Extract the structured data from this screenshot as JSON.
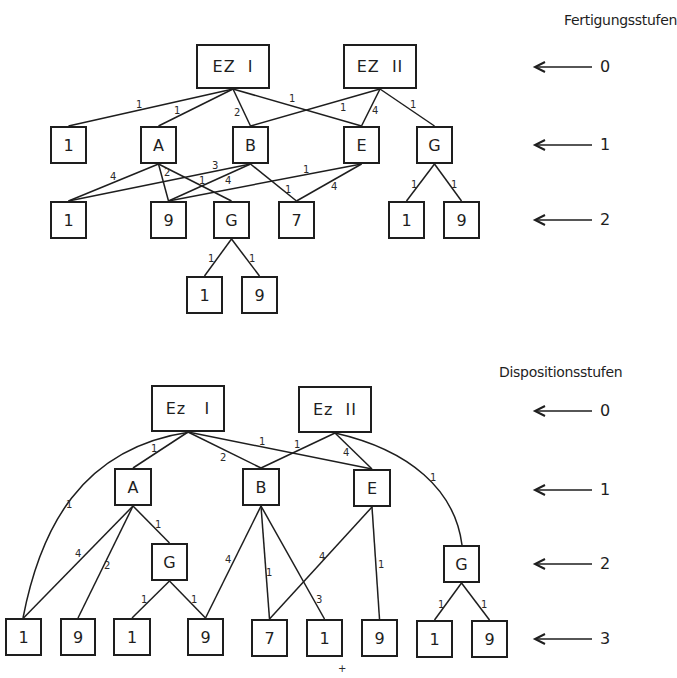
{
  "diagrams": [
    {
      "id": "fertigung",
      "title": "Fertigungsstufen",
      "title_pos": [
        564,
        12
      ],
      "levels": [
        {
          "label": "0",
          "y": 67
        },
        {
          "label": "1",
          "y": 145
        },
        {
          "label": "2",
          "y": 220
        }
      ],
      "nodes": [
        {
          "id": "t_ez1",
          "label": "EZ  I",
          "x": 196,
          "y": 44,
          "w": 74,
          "h": 45,
          "root": true
        },
        {
          "id": "t_ez2",
          "label": "EZ  II",
          "x": 343,
          "y": 44,
          "w": 74,
          "h": 45,
          "root": true
        },
        {
          "id": "t_l1_1",
          "label": "1",
          "x": 50,
          "y": 126,
          "w": 37,
          "h": 38
        },
        {
          "id": "t_l1_A",
          "label": "A",
          "x": 140,
          "y": 126,
          "w": 37,
          "h": 38
        },
        {
          "id": "t_l1_B",
          "label": "B",
          "x": 232,
          "y": 126,
          "w": 37,
          "h": 38
        },
        {
          "id": "t_l1_E",
          "label": "E",
          "x": 343,
          "y": 126,
          "w": 37,
          "h": 38
        },
        {
          "id": "t_l1_G",
          "label": "G",
          "x": 416,
          "y": 126,
          "w": 37,
          "h": 38
        },
        {
          "id": "t_l2_1",
          "label": "1",
          "x": 50,
          "y": 201,
          "w": 37,
          "h": 38
        },
        {
          "id": "t_l2_9",
          "label": "9",
          "x": 150,
          "y": 201,
          "w": 37,
          "h": 38
        },
        {
          "id": "t_l2_G",
          "label": "G",
          "x": 213,
          "y": 201,
          "w": 37,
          "h": 38
        },
        {
          "id": "t_l2_7",
          "label": "7",
          "x": 278,
          "y": 201,
          "w": 37,
          "h": 38
        },
        {
          "id": "t_l2_1b",
          "label": "1",
          "x": 388,
          "y": 201,
          "w": 37,
          "h": 38
        },
        {
          "id": "t_l2_9b",
          "label": "9",
          "x": 443,
          "y": 201,
          "w": 37,
          "h": 38
        },
        {
          "id": "t_l3_1",
          "label": "1",
          "x": 186,
          "y": 276,
          "w": 37,
          "h": 38
        },
        {
          "id": "t_l3_9",
          "label": "9",
          "x": 241,
          "y": 276,
          "w": 37,
          "h": 38
        }
      ],
      "edges": [
        {
          "from": "t_ez1",
          "to": "t_l1_1",
          "qty": "1",
          "lx": 136,
          "ly": 100
        },
        {
          "from": "t_ez1",
          "to": "t_l1_A",
          "qty": "1",
          "lx": 174,
          "ly": 106
        },
        {
          "from": "t_ez1",
          "to": "t_l1_B",
          "qty": "2",
          "lx": 234,
          "ly": 108
        },
        {
          "from": "t_ez1",
          "to": "t_l1_E",
          "qty": "1",
          "lx": 289,
          "ly": 94
        },
        {
          "from": "t_ez2",
          "to": "t_l1_B",
          "qty": "1",
          "lx": 340,
          "ly": 103
        },
        {
          "from": "t_ez2",
          "to": "t_l1_E",
          "qty": "4",
          "lx": 372,
          "ly": 106
        },
        {
          "from": "t_ez2",
          "to": "t_l1_G",
          "qty": "1",
          "lx": 410,
          "ly": 100
        },
        {
          "from": "t_l1_A",
          "to": "t_l2_1",
          "qty": "4",
          "lx": 110,
          "ly": 172
        },
        {
          "from": "t_l1_A",
          "to": "t_l2_9",
          "qty": "2",
          "lx": 164,
          "ly": 168
        },
        {
          "from": "t_l1_A",
          "to": "t_l2_G",
          "qty": "1",
          "lx": 199,
          "ly": 176
        },
        {
          "from": "t_l1_B",
          "to": "t_l2_1",
          "qty": "3",
          "lx": 212,
          "ly": 161
        },
        {
          "from": "t_l1_B",
          "to": "t_l2_9",
          "qty": "4",
          "lx": 225,
          "ly": 176
        },
        {
          "from": "t_l1_B",
          "to": "t_l2_7",
          "qty": "1",
          "lx": 285,
          "ly": 185
        },
        {
          "from": "t_l1_E",
          "to": "t_l2_9",
          "qty": "1",
          "lx": 303,
          "ly": 165
        },
        {
          "from": "t_l1_E",
          "to": "t_l2_7",
          "qty": "4",
          "lx": 331,
          "ly": 182
        },
        {
          "from": "t_l1_G",
          "to": "t_l2_1b",
          "qty": "1",
          "lx": 411,
          "ly": 180
        },
        {
          "from": "t_l1_G",
          "to": "t_l2_9b",
          "qty": "1",
          "lx": 451,
          "ly": 180
        },
        {
          "from": "t_l2_G",
          "to": "t_l3_1",
          "qty": "1",
          "lx": 208,
          "ly": 254
        },
        {
          "from": "t_l2_G",
          "to": "t_l3_9",
          "qty": "1",
          "lx": 249,
          "ly": 254
        }
      ]
    },
    {
      "id": "disposition",
      "title": "Dispositionsstufen",
      "title_pos": [
        499,
        364
      ],
      "levels": [
        {
          "label": "0",
          "y": 411
        },
        {
          "label": "1",
          "y": 490
        },
        {
          "label": "2",
          "y": 564
        },
        {
          "label": "3",
          "y": 639
        }
      ],
      "nodes": [
        {
          "id": "b_ez1",
          "label": "Ez   I",
          "x": 151,
          "y": 385,
          "w": 74,
          "h": 47,
          "root": true
        },
        {
          "id": "b_ez2",
          "label": "Ez  II",
          "x": 298,
          "y": 386,
          "w": 74,
          "h": 47,
          "root": true
        },
        {
          "id": "b_l1_A",
          "label": "A",
          "x": 114,
          "y": 468,
          "w": 38,
          "h": 38
        },
        {
          "id": "b_l1_B",
          "label": "B",
          "x": 242,
          "y": 468,
          "w": 38,
          "h": 38
        },
        {
          "id": "b_l1_E",
          "label": "E",
          "x": 353,
          "y": 469,
          "w": 38,
          "h": 38
        },
        {
          "id": "b_l2_G",
          "label": "G",
          "x": 151,
          "y": 543,
          "w": 37,
          "h": 38
        },
        {
          "id": "b_l2_Gb",
          "label": "G",
          "x": 443,
          "y": 545,
          "w": 37,
          "h": 38
        },
        {
          "id": "b_l3_1",
          "label": "1",
          "x": 5,
          "y": 618,
          "w": 37,
          "h": 38
        },
        {
          "id": "b_l3_9",
          "label": "9",
          "x": 60,
          "y": 618,
          "w": 36,
          "h": 38
        },
        {
          "id": "b_l3_1b",
          "label": "1",
          "x": 113,
          "y": 618,
          "w": 38,
          "h": 38
        },
        {
          "id": "b_l3_9b",
          "label": "9",
          "x": 187,
          "y": 618,
          "w": 37,
          "h": 38
        },
        {
          "id": "b_l3_7",
          "label": "7",
          "x": 251,
          "y": 619,
          "w": 37,
          "h": 38
        },
        {
          "id": "b_l3_1c",
          "label": "1",
          "x": 306,
          "y": 619,
          "w": 37,
          "h": 38
        },
        {
          "id": "b_l3_9c",
          "label": "9",
          "x": 361,
          "y": 619,
          "w": 37,
          "h": 38
        },
        {
          "id": "b_l3_1d",
          "label": "1",
          "x": 416,
          "y": 620,
          "w": 37,
          "h": 38
        },
        {
          "id": "b_l3_9d",
          "label": "9",
          "x": 471,
          "y": 620,
          "w": 37,
          "h": 38
        }
      ],
      "edges": [
        {
          "from": "b_ez1",
          "to": "b_l1_A",
          "qty": "1",
          "lx": 151,
          "ly": 444
        },
        {
          "from": "b_ez1",
          "to": "b_l1_B",
          "qty": "2",
          "lx": 220,
          "ly": 453
        },
        {
          "from": "b_ez1",
          "to": "b_l1_E",
          "qty": "1",
          "lx": 259,
          "ly": 437
        },
        {
          "from": "b_ez2",
          "to": "b_l1_B",
          "qty": "1",
          "lx": 294,
          "ly": 440
        },
        {
          "from": "b_ez2",
          "to": "b_l1_E",
          "qty": "4",
          "lx": 343,
          "ly": 448
        },
        {
          "from": "b_ez1",
          "to": "b_l3_1",
          "qty": "1",
          "lx": 66,
          "ly": 500,
          "curve": "M190 432 C 80 448, 40 530, 23 618"
        },
        {
          "from": "b_ez2",
          "to": "b_l2_Gb",
          "qty": "1",
          "lx": 430,
          "ly": 473,
          "curve": "M335 433 C 410 450, 455 490, 462 545"
        },
        {
          "from": "b_l1_A",
          "to": "b_l3_1",
          "qty": "4",
          "lx": 75,
          "ly": 549
        },
        {
          "from": "b_l1_A",
          "to": "b_l3_9",
          "qty": "2",
          "lx": 104,
          "ly": 561
        },
        {
          "from": "b_l1_A",
          "to": "b_l2_G",
          "qty": "1",
          "lx": 155,
          "ly": 520
        },
        {
          "from": "b_l2_G",
          "to": "b_l3_1b",
          "qty": "1",
          "lx": 141,
          "ly": 595
        },
        {
          "from": "b_l2_G",
          "to": "b_l3_9b",
          "qty": "1",
          "lx": 191,
          "ly": 595
        },
        {
          "from": "b_l1_B",
          "to": "b_l3_9b",
          "qty": "4",
          "lx": 225,
          "ly": 555
        },
        {
          "from": "b_l1_B",
          "to": "b_l3_7",
          "qty": "1",
          "lx": 266,
          "ly": 568
        },
        {
          "from": "b_l1_B",
          "to": "b_l3_1c",
          "qty": "3",
          "lx": 316,
          "ly": 595
        },
        {
          "from": "b_l1_E",
          "to": "b_l3_7",
          "qty": "4",
          "lx": 319,
          "ly": 552
        },
        {
          "from": "b_l1_E",
          "to": "b_l3_9c",
          "qty": "1",
          "lx": 378,
          "ly": 560
        },
        {
          "from": "b_l2_Gb",
          "to": "b_l3_1d",
          "qty": "1",
          "lx": 438,
          "ly": 600
        },
        {
          "from": "b_l2_Gb",
          "to": "b_l3_9d",
          "qty": "1",
          "lx": 481,
          "ly": 600
        }
      ]
    }
  ],
  "level_arrow": {
    "x_head": 535,
    "x_tail": 592,
    "x_label": 600
  },
  "stray_mark": {
    "text": "+",
    "x": 338,
    "y": 664
  },
  "colors": {
    "ink": "#1e1e1e",
    "background": "#ffffff"
  }
}
